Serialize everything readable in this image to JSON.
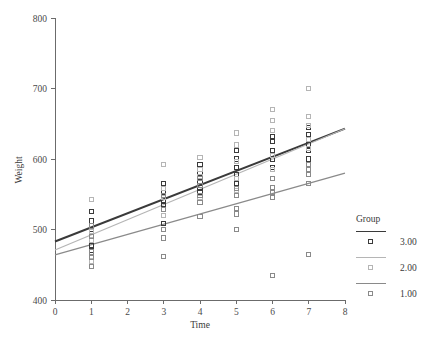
{
  "chart_data": {
    "type": "scatter",
    "title": "",
    "xlabel": "Time",
    "ylabel": "Weight",
    "xlim": [
      0,
      8
    ],
    "ylim": [
      400,
      800
    ],
    "xticks": [
      "0",
      "1",
      "2",
      "3",
      "4",
      "5",
      "6",
      "7",
      "8"
    ],
    "yticks": [
      "400",
      "500",
      "600",
      "700",
      "800"
    ],
    "xtick_values": [
      0,
      1,
      2,
      3,
      4,
      5,
      6,
      7,
      8
    ],
    "ytick_values": [
      400,
      500,
      600,
      700,
      800
    ],
    "grid": false,
    "legend": {
      "title": "Group",
      "position": "right",
      "entries": [
        {
          "label": "3.00",
          "color": "#3a3a3a",
          "line_width": 2.0,
          "marker": "open-square"
        },
        {
          "label": "2.00",
          "color": "#b5b5b5",
          "line_width": 1.2,
          "marker": "open-square"
        },
        {
          "label": "1.00",
          "color": "#8a8a8a",
          "line_width": 1.2,
          "marker": "open-square"
        }
      ]
    },
    "series": [
      {
        "name": "3.00",
        "color": "#3a3a3a",
        "marker": "open-square",
        "fit_line": {
          "intercept": 483,
          "slope": 20.0,
          "x_start": 0,
          "x_end": 8,
          "width": 2.0
        },
        "points": [
          {
            "x": 1,
            "y": 470
          },
          {
            "x": 1,
            "y": 477
          },
          {
            "x": 1,
            "y": 500
          },
          {
            "x": 1,
            "y": 512
          },
          {
            "x": 1,
            "y": 525
          },
          {
            "x": 3,
            "y": 508
          },
          {
            "x": 3,
            "y": 535
          },
          {
            "x": 3,
            "y": 540
          },
          {
            "x": 3,
            "y": 552
          },
          {
            "x": 3,
            "y": 565
          },
          {
            "x": 4,
            "y": 552
          },
          {
            "x": 4,
            "y": 560
          },
          {
            "x": 4,
            "y": 568
          },
          {
            "x": 4,
            "y": 580
          },
          {
            "x": 4,
            "y": 592
          },
          {
            "x": 5,
            "y": 565
          },
          {
            "x": 5,
            "y": 578
          },
          {
            "x": 5,
            "y": 588
          },
          {
            "x": 5,
            "y": 600
          },
          {
            "x": 5,
            "y": 612
          },
          {
            "x": 6,
            "y": 588
          },
          {
            "x": 6,
            "y": 600
          },
          {
            "x": 6,
            "y": 612
          },
          {
            "x": 6,
            "y": 625
          },
          {
            "x": 6,
            "y": 632
          },
          {
            "x": 7,
            "y": 600
          },
          {
            "x": 7,
            "y": 612
          },
          {
            "x": 7,
            "y": 620
          },
          {
            "x": 7,
            "y": 635
          },
          {
            "x": 7,
            "y": 645
          }
        ]
      },
      {
        "name": "2.00",
        "color": "#b5b5b5",
        "marker": "open-square",
        "fit_line": {
          "intercept": 471,
          "slope": 21.5,
          "x_start": 0,
          "x_end": 8,
          "width": 1.2
        },
        "points": [
          {
            "x": 1,
            "y": 455
          },
          {
            "x": 1,
            "y": 462
          },
          {
            "x": 1,
            "y": 485
          },
          {
            "x": 1,
            "y": 497
          },
          {
            "x": 1,
            "y": 543
          },
          {
            "x": 3,
            "y": 500
          },
          {
            "x": 3,
            "y": 520
          },
          {
            "x": 3,
            "y": 545
          },
          {
            "x": 3,
            "y": 558
          },
          {
            "x": 3,
            "y": 592
          },
          {
            "x": 4,
            "y": 545
          },
          {
            "x": 4,
            "y": 562
          },
          {
            "x": 4,
            "y": 575
          },
          {
            "x": 4,
            "y": 585
          },
          {
            "x": 4,
            "y": 602
          },
          {
            "x": 5,
            "y": 555
          },
          {
            "x": 5,
            "y": 572
          },
          {
            "x": 5,
            "y": 596
          },
          {
            "x": 5,
            "y": 620
          },
          {
            "x": 5,
            "y": 637
          },
          {
            "x": 6,
            "y": 585
          },
          {
            "x": 6,
            "y": 605
          },
          {
            "x": 6,
            "y": 640
          },
          {
            "x": 6,
            "y": 655
          },
          {
            "x": 6,
            "y": 670
          },
          {
            "x": 7,
            "y": 615
          },
          {
            "x": 7,
            "y": 628
          },
          {
            "x": 7,
            "y": 648
          },
          {
            "x": 7,
            "y": 660
          },
          {
            "x": 7,
            "y": 700
          }
        ]
      },
      {
        "name": "1.00",
        "color": "#8a8a8a",
        "marker": "open-square",
        "fit_line": {
          "intercept": 464,
          "slope": 14.5,
          "x_start": 0,
          "x_end": 8,
          "width": 1.2
        },
        "points": [
          {
            "x": 1,
            "y": 448
          },
          {
            "x": 1,
            "y": 460
          },
          {
            "x": 1,
            "y": 468
          },
          {
            "x": 1,
            "y": 490
          },
          {
            "x": 1,
            "y": 505
          },
          {
            "x": 3,
            "y": 462
          },
          {
            "x": 3,
            "y": 488
          },
          {
            "x": 3,
            "y": 500
          },
          {
            "x": 3,
            "y": 528
          },
          {
            "x": 3,
            "y": 548
          },
          {
            "x": 4,
            "y": 518
          },
          {
            "x": 4,
            "y": 538
          },
          {
            "x": 4,
            "y": 548
          },
          {
            "x": 4,
            "y": 562
          },
          {
            "x": 4,
            "y": 572
          },
          {
            "x": 5,
            "y": 500
          },
          {
            "x": 5,
            "y": 522
          },
          {
            "x": 5,
            "y": 530
          },
          {
            "x": 5,
            "y": 548
          },
          {
            "x": 5,
            "y": 558
          },
          {
            "x": 6,
            "y": 435
          },
          {
            "x": 6,
            "y": 545
          },
          {
            "x": 6,
            "y": 552
          },
          {
            "x": 6,
            "y": 560
          },
          {
            "x": 6,
            "y": 572
          },
          {
            "x": 7,
            "y": 465
          },
          {
            "x": 7,
            "y": 565
          },
          {
            "x": 7,
            "y": 578
          },
          {
            "x": 7,
            "y": 585
          },
          {
            "x": 7,
            "y": 592
          }
        ]
      }
    ]
  }
}
